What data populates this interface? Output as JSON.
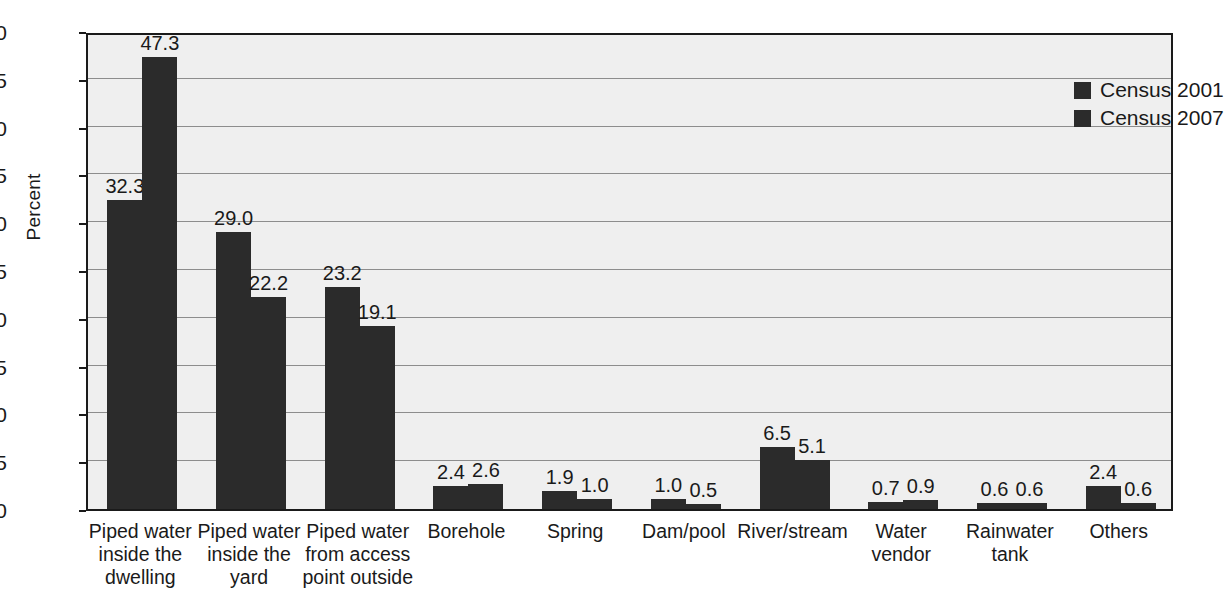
{
  "chart_data": {
    "type": "bar",
    "title": "",
    "subtitle": "",
    "xlabel": "",
    "ylabel": "Percent",
    "ylim": [
      0,
      50
    ],
    "ytick_step": 5,
    "yticks": [
      "0",
      "5",
      "10",
      "15",
      "20",
      "25",
      "30",
      "35",
      "40",
      "45",
      "50"
    ],
    "grid": true,
    "legend_position": "top-right",
    "categories": [
      "Piped water inside the dwelling",
      "Piped water inside the yard",
      "Piped water from access point outside",
      "Borehole",
      "Spring",
      "Dam/pool",
      "River/stream",
      "Water vendor",
      "Rainwater tank",
      "Others"
    ],
    "category_lines": [
      [
        "Piped water",
        "inside the",
        "dwelling"
      ],
      [
        "Piped water",
        "inside the",
        "yard"
      ],
      [
        "Piped water",
        "from access",
        "point outside"
      ],
      [
        "Borehole"
      ],
      [
        "Spring"
      ],
      [
        "Dam/pool"
      ],
      [
        "River/stream"
      ],
      [
        "Water",
        "vendor"
      ],
      [
        "Rainwater",
        "tank"
      ],
      [
        "Others"
      ]
    ],
    "series": [
      {
        "name": "Census 2001",
        "color": "#2b2b2b",
        "values": [
          32.3,
          29.0,
          23.2,
          2.4,
          1.9,
          1.0,
          6.5,
          0.7,
          0.6,
          2.4
        ],
        "labels": [
          "32.3",
          "29.0",
          "23.2",
          "2.4",
          "1.9",
          "1.0",
          "6.5",
          "0.7",
          "0.6",
          "2.4"
        ]
      },
      {
        "name": "Census 2007",
        "color": "#2b2b2b",
        "values": [
          47.3,
          22.2,
          19.1,
          2.6,
          1.0,
          0.5,
          5.1,
          0.9,
          0.6,
          0.6
        ],
        "labels": [
          "47.3",
          "22.2",
          "19.1",
          "2.6",
          "1.0",
          "0.5",
          "5.1",
          "0.9",
          "0.6",
          "0.6"
        ]
      }
    ]
  },
  "legend": {
    "items": [
      {
        "label": "Census 2001",
        "color": "#2b2b2b"
      },
      {
        "label": "Census 2007",
        "color": "#2b2b2b"
      }
    ]
  },
  "style": {
    "plot_background": "#efefef",
    "axis_color": "#1a1a1a",
    "grid_color": "#8d8d8d",
    "bar_color": "#2b2b2b",
    "page_background": "#ffffff"
  }
}
